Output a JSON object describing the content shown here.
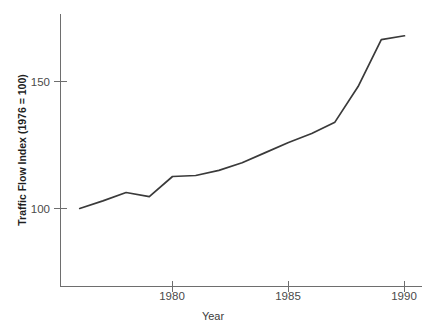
{
  "chart_data": {
    "type": "line",
    "title": "",
    "subtitle": "",
    "xlabel": "Year",
    "ylabel": "Traffic Flow Index (1976 = 100)",
    "xlim": [
      1975.2,
      1990.6
    ],
    "ylim": [
      69,
      185
    ],
    "grid": false,
    "legend": null,
    "legend_position": "none",
    "x_ticks": [
      1980,
      1985,
      1990
    ],
    "x_tick_labels": [
      "1980",
      "1985",
      "1990"
    ],
    "y_ticks": [
      100,
      150
    ],
    "y_tick_labels": [
      "100",
      "150"
    ],
    "series": [
      {
        "name": "Traffic Flow Index",
        "color": "#3a3a3a",
        "x": [
          1976,
          1977,
          1978,
          1979,
          1980,
          1981,
          1982,
          1983,
          1984,
          1985,
          1986,
          1987,
          1988,
          1989,
          1990
        ],
        "values": [
          100,
          103,
          106.3,
          104.7,
          112.6,
          113,
          115,
          118,
          122,
          126,
          129.5,
          134,
          148,
          166.5,
          168
        ]
      }
    ]
  },
  "axes": {
    "y_axis_label": "Traffic Flow Index (1976 = 100)",
    "x_axis_label": "Year",
    "y_tick_100": "100",
    "y_tick_150": "150",
    "x_tick_1980": "1980",
    "x_tick_1985": "1985",
    "x_tick_1990": "1990"
  },
  "style": {
    "line_color": "#3a3a3a",
    "axis_color": "#6e6e6e",
    "background": "#ffffff",
    "tick_label_color": "#4a4a4a"
  }
}
